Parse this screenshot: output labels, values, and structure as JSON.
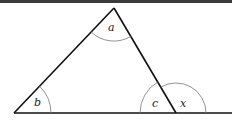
{
  "diagram": {
    "angles": {
      "apex": "a",
      "left_base": "b",
      "right_base_interior": "c",
      "right_base_exterior": "x"
    },
    "colors": {
      "line": "#111111",
      "arc": "#777777",
      "label": "#222222",
      "topbar": "#3a3a3a"
    }
  }
}
